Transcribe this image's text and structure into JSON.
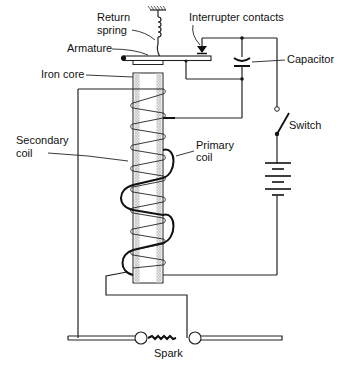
{
  "diagram": {
    "labels": {
      "return_spring_line1": "Return",
      "return_spring_line2": "spring",
      "interrupter_contacts": "Interrupter contacts",
      "armature": "Armature",
      "capacitor": "Capacitor",
      "iron_core": "Iron core",
      "switch": "Switch",
      "secondary_coil_line1": "Secondary",
      "secondary_coil_line2": "coil",
      "primary_coil_line1": "Primary",
      "primary_coil_line2": "coil",
      "spark": "Spark"
    },
    "components": [
      "return-spring",
      "armature",
      "interrupter-contacts",
      "capacitor",
      "iron-core",
      "secondary-coil",
      "primary-coil",
      "switch",
      "battery",
      "spark-gap"
    ],
    "colors": {
      "line": "#222222",
      "core_hatch": "#b8b8b8",
      "background": "#ffffff"
    }
  }
}
